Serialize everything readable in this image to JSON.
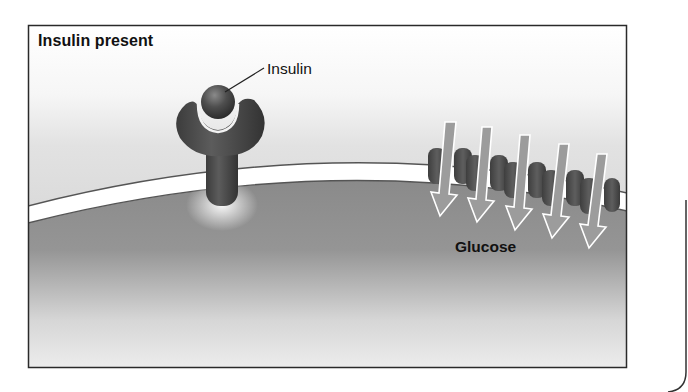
{
  "figure": {
    "title": "Insulin present",
    "labels": {
      "insulin": "Insulin",
      "glucose": "Glucose"
    },
    "elements": {
      "receptor": {
        "icon": "insulin-receptor-icon",
        "count": 1
      },
      "insulin_molecule": {
        "icon": "insulin-ball-icon",
        "count": 1
      },
      "glucose_transporters": {
        "icon": "transporter-icon",
        "count": 5
      },
      "glucose_arrows": {
        "icon": "down-arrow-icon",
        "count": 5,
        "direction": "into cell"
      }
    },
    "colors": {
      "border": "#2a2a2a",
      "extracellular_bg": "#e6e6e6",
      "membrane": "#ffffff",
      "cytoplasm": "#8f8f8f",
      "receptor": "#4a4a4a",
      "arrow_fill": "#9a9a9a",
      "arrow_outline": "#ffffff"
    }
  }
}
